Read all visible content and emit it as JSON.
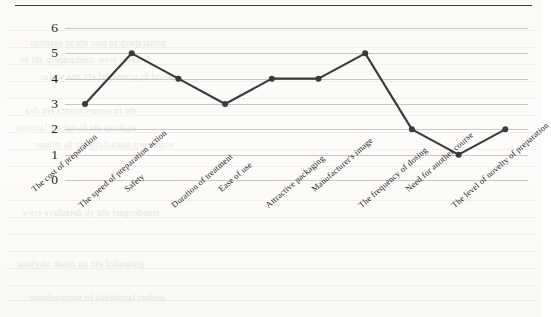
{
  "figure": {
    "top_rule": true,
    "background_hex": "#fcfbf9",
    "line_color_hex": "#3a3a3a",
    "grid_color_hex": "#c9c7c2"
  },
  "chart_data": {
    "type": "line",
    "title": "",
    "xlabel": "",
    "ylabel": "",
    "ylim": [
      0,
      6
    ],
    "yticks": [
      0,
      1,
      2,
      3,
      4,
      5,
      6
    ],
    "grid": true,
    "legend": "none",
    "markers": true,
    "categories": [
      "The cost of preparation",
      "The speed of preparation action",
      "Safety",
      "Duration of treatment",
      "Ease of use",
      "Attractive packaging",
      "Manufacturer's image",
      "The frequency of dosing",
      "Need for another course",
      "The level of novelty of preparation"
    ],
    "values": [
      3,
      5,
      4,
      3,
      4,
      4,
      5,
      2,
      1,
      2
    ]
  },
  "bleed_through": {
    "note": "faint mirrored text showing through the scanned page",
    "lines": [
      "noitaraperp fo tsoc eht ni esaercni",
      "detceles erew snoitaraperp eht fo",
      "gnisod fo ycneuqerf eht dna ytefas",
      "eht fo ssenevitcartta eht dna",
      "egakcap eht fo ngised lanretxe",
      "erudecorp noitaulave eht fo stluser",
      "stnednopser eht yb detaulave erew",
      "gniwollof eht no desab sisylana",
      "seiduts lanoitidda fo noitaredisnoc"
    ]
  }
}
